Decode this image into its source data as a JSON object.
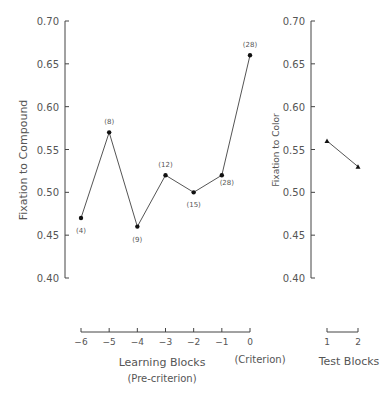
{
  "chart_data": [
    {
      "type": "line",
      "title": "",
      "xlabel": "Learning Blocks",
      "xlabel_sub": "(Pre-criterion)",
      "x_annotation": "(Criterion)",
      "ylabel": "Fixation to Compound",
      "ylim": [
        0.4,
        0.7
      ],
      "yticks": [
        "0.40",
        "0.45",
        "0.50",
        "0.55",
        "0.60",
        "0.65",
        "0.70"
      ],
      "x": [
        -6,
        -5,
        -4,
        -3,
        -2,
        -1,
        0
      ],
      "xtick_labels": [
        "−6",
        "−5",
        "−4",
        "−3",
        "−2",
        "−1",
        "0"
      ],
      "series": [
        {
          "name": "Fixation to Compound",
          "marker": "circle",
          "values": [
            0.47,
            0.57,
            0.46,
            0.52,
            0.5,
            0.52,
            0.66
          ],
          "n_labels": [
            "(4)",
            "(8)",
            "(9)",
            "(12)",
            "(15)",
            "(28)",
            "(28)"
          ]
        }
      ],
      "grid": false,
      "legend": "none"
    },
    {
      "type": "line",
      "title": "",
      "xlabel": "Test Blocks",
      "ylabel": "Fixation to Color",
      "ylim": [
        0.4,
        0.7
      ],
      "yticks": [
        "0.40",
        "0.45",
        "0.50",
        "0.55",
        "0.60",
        "0.65",
        "0.70"
      ],
      "x": [
        1,
        2
      ],
      "xtick_labels": [
        "1",
        "2"
      ],
      "series": [
        {
          "name": "Fixation to Color",
          "marker": "triangle",
          "values": [
            0.56,
            0.53
          ]
        }
      ],
      "grid": false,
      "legend": "none"
    }
  ],
  "colors": {
    "line": "#555555",
    "marker": "#111111",
    "text": "#555555",
    "axis": "#444444"
  }
}
